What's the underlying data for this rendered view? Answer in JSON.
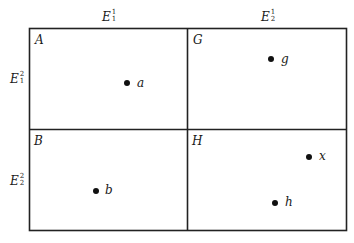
{
  "diagram": {
    "type": "partition-grid",
    "colors": {
      "line": "#222222",
      "point": "#111111",
      "background": "#ffffff"
    },
    "column_headers": [
      {
        "base": "E",
        "sup": "1",
        "sub": "1"
      },
      {
        "base": "E",
        "sup": "1",
        "sub": "2"
      }
    ],
    "row_headers": [
      {
        "base": "E",
        "sup": "2",
        "sub": "1"
      },
      {
        "base": "E",
        "sup": "2",
        "sub": "2"
      }
    ],
    "cells": [
      {
        "label": "A",
        "row": 1,
        "col": 1,
        "points": [
          {
            "label": "a"
          }
        ]
      },
      {
        "label": "G",
        "row": 1,
        "col": 2,
        "points": [
          {
            "label": "g"
          }
        ]
      },
      {
        "label": "B",
        "row": 2,
        "col": 1,
        "points": [
          {
            "label": "b"
          }
        ]
      },
      {
        "label": "H",
        "row": 2,
        "col": 2,
        "points": [
          {
            "label": "x"
          },
          {
            "label": "h"
          }
        ]
      }
    ]
  }
}
